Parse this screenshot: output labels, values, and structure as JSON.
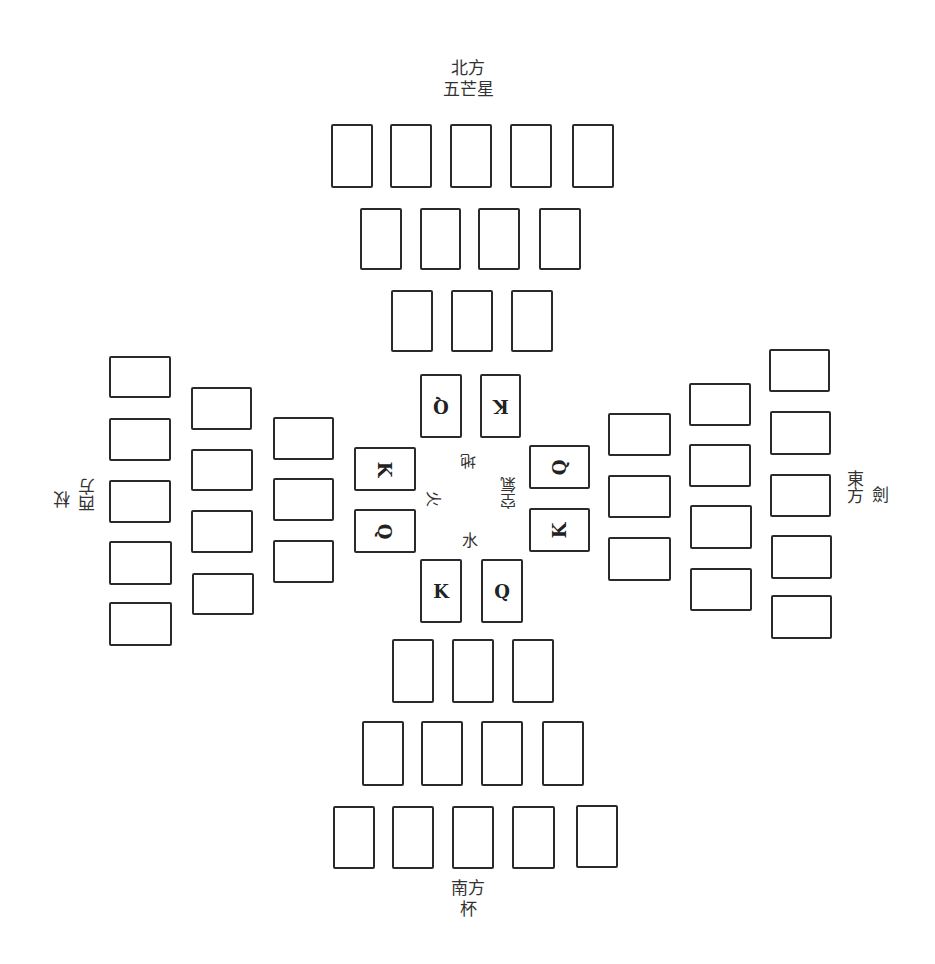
{
  "diagram": {
    "type": "card-spread",
    "directions": {
      "north": {
        "line1": "北方",
        "line2": "五芒星"
      },
      "south": {
        "line1": "南方",
        "line2": "杯"
      },
      "west": {
        "line1": "西方",
        "line2": "杖"
      },
      "east": {
        "line1": "東方",
        "line2": "劍"
      }
    },
    "elements": {
      "earth": "地",
      "fire": "火",
      "air": "空氣",
      "water": "水"
    },
    "center_cards": {
      "north_left": "Q",
      "north_right": "K",
      "west_top": "K",
      "west_bottom": "Q",
      "east_top": "Q",
      "east_bottom": "K",
      "south_left": "K",
      "south_right": "Q"
    },
    "blank_card_counts": {
      "north": [
        5,
        4,
        3
      ],
      "south": [
        3,
        4,
        5
      ],
      "west": [
        5,
        4,
        3
      ],
      "east": [
        3,
        4,
        5
      ]
    }
  }
}
